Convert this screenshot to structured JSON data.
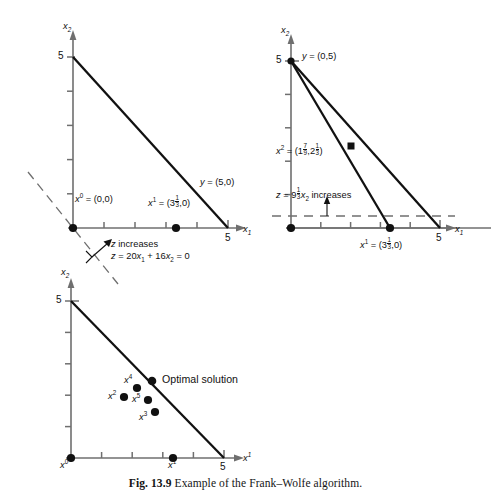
{
  "figure": {
    "number": "Fig. 13.9",
    "caption": "Example of the Frank–Wolfe algorithm."
  },
  "panels": [
    {
      "id": "panel-iteration-1",
      "axes": {
        "x_label": "x₁",
        "y_label": "x₂",
        "x_tick_label": "5",
        "y_tick_label": "5",
        "x_max": 5,
        "y_max": 5,
        "ticks": [
          1,
          2,
          3,
          4,
          5
        ]
      },
      "constraint_line": {
        "from": [
          0,
          5
        ],
        "to": [
          5,
          0
        ]
      },
      "points": [
        {
          "name": "x0",
          "label_html": "x<sup>0</sup> = (0,0)",
          "coords": [
            0,
            0
          ]
        },
        {
          "name": "x1",
          "label_html": "x<sup>1</sup> = (3⅓,0)",
          "coords": [
            3.3333,
            0
          ]
        }
      ],
      "line_label": "y = (5,0)",
      "gradient_note_line1": "z increases",
      "gradient_note_line2": "z = 20x₁ + 16x₂ = 0",
      "dashed_contour": {
        "slope": -1.25,
        "through": [
          0,
          0
        ]
      }
    },
    {
      "id": "panel-iteration-2",
      "axes": {
        "x_label": "x₁",
        "y_label": "x₂",
        "x_tick_label": "5",
        "y_tick_label": "5",
        "x_max": 5,
        "y_max": 5,
        "ticks": [
          1,
          2,
          3,
          4,
          5
        ]
      },
      "constraint_line": {
        "from": [
          0,
          5
        ],
        "to": [
          5,
          0
        ]
      },
      "points": [
        {
          "name": "origin",
          "label_html": "",
          "coords": [
            0,
            0
          ]
        },
        {
          "name": "y",
          "label_html": "y = (0,5)",
          "coords": [
            0,
            5
          ]
        },
        {
          "name": "x2",
          "label_html": "x<sup>2</sup> = (1⁷⁄₉,2⅓)",
          "coords": [
            1.7778,
            2.3333
          ]
        },
        {
          "name": "x1",
          "label_html": "x<sup>1</sup> = (3⅓,0)",
          "coords": [
            3.3333,
            0
          ]
        }
      ],
      "objective_note": "z = 9⅓x₂ increases",
      "dashed_contour_y": 0.4
    },
    {
      "id": "panel-convergence",
      "axes": {
        "x_label": "x¹",
        "y_label": "x₂",
        "x_tick_label": "5",
        "y_tick_label": "5",
        "x_max": 5,
        "y_max": 5,
        "ticks": [
          1,
          2,
          3,
          4,
          5
        ]
      },
      "constraint_line": {
        "from": [
          0,
          5
        ],
        "to": [
          5,
          0
        ]
      },
      "optimal_label": "Optimal solution",
      "points": [
        {
          "name": "x0",
          "label_html": "x<sup>0</sup>",
          "coords": [
            0,
            0
          ]
        },
        {
          "name": "x1",
          "label_html": "x<sup>1</sup>",
          "coords": [
            3.3333,
            0
          ]
        },
        {
          "name": "x2",
          "label_html": "x<sup>2</sup>",
          "coords": [
            1.7,
            1.7
          ]
        },
        {
          "name": "x3",
          "label_html": "x<sup>3</sup>",
          "coords": [
            2.75,
            1.2
          ]
        },
        {
          "name": "x4",
          "label_html": "x<sup>4</sup>",
          "coords": [
            2.15,
            2.05
          ]
        },
        {
          "name": "x5",
          "label_html": "x<sup>5</sup>",
          "coords": [
            2.5,
            1.7
          ]
        },
        {
          "name": "optimal",
          "label_html": "",
          "coords": [
            2.6,
            2.4
          ]
        }
      ]
    }
  ],
  "colors": {
    "ink": "#111111",
    "axis": "#6f6f6f",
    "line": "#111111"
  }
}
